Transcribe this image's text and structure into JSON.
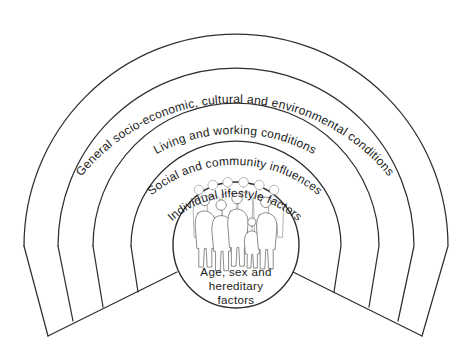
{
  "diagram": {
    "background_color": "#ffffff",
    "stroke_color": "#2f2f2f",
    "text_color": "#1b1b1b",
    "type": "concentric-arc-layers",
    "layers": [
      {
        "index": 1,
        "label": "General socio-economic, cultural and environmental conditions",
        "position": "outermost"
      },
      {
        "index": 2,
        "label": "Living and working conditions",
        "position": "second"
      },
      {
        "index": 3,
        "label": "Social and community influences",
        "position": "third"
      },
      {
        "index": 4,
        "label": "Individual lifestyle factors",
        "position": "innermost-arc"
      }
    ],
    "core": {
      "name": "core-circle",
      "label_lines": [
        "Age, sex and",
        "hereditary",
        "factors"
      ],
      "line1": "Age, sex and",
      "line2": "hereditary",
      "line3": "factors",
      "illustration": "group-of-people"
    }
  }
}
